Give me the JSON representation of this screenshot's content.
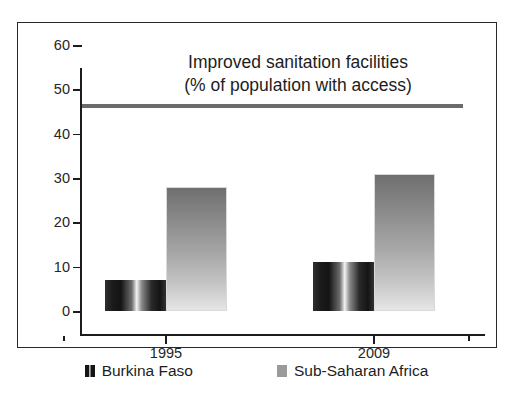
{
  "clipped_header": "",
  "chart_data": {
    "type": "bar",
    "title": "Improved sanitation facilities",
    "subtitle": "(% of population with access)",
    "xlabel": "",
    "ylabel": "",
    "categories": [
      "1995",
      "2009"
    ],
    "series": [
      {
        "name": "Burkina Faso",
        "values": [
          7,
          11
        ],
        "color": "#141414"
      },
      {
        "name": "Sub-Saharan Africa",
        "values": [
          28,
          31
        ],
        "color": "#9a9a9a"
      }
    ],
    "ylim": [
      0,
      60
    ],
    "yticks": [
      0,
      10,
      20,
      30,
      40,
      50,
      60
    ],
    "ytick_labels": [
      "0",
      "10",
      "20",
      "30",
      "40",
      "50",
      "60"
    ],
    "grid": false,
    "legend_position": "bottom",
    "annotations": [
      {
        "type": "horizontal-rule",
        "value": 52,
        "color": "#6b6b6b"
      }
    ]
  }
}
